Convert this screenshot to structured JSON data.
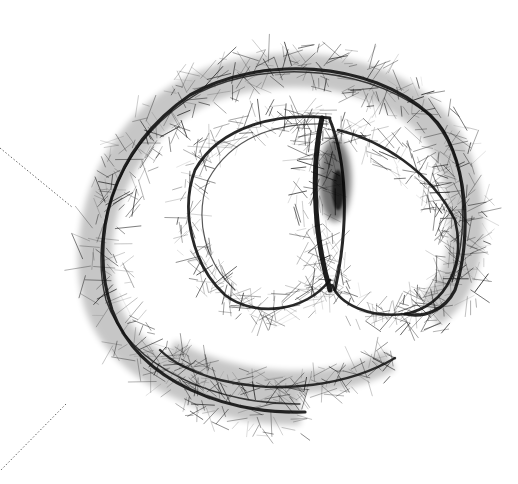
{
  "image": {
    "description": "Hand-drawn at-sign (@) symbol rendered with dense hair-like pen strokes on a white background, with two faint dotted guide lines on the left edge",
    "subject": "at-sign",
    "colors": {
      "background": "#ffffff",
      "ink": "#111111",
      "ink_light": "#555555",
      "guide_line": "#666666"
    }
  }
}
